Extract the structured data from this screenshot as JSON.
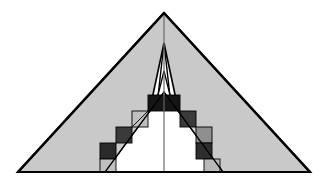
{
  "figure": {
    "type": "geometric-diagram",
    "canvas": {
      "width": 328,
      "height": 182,
      "background": "#ffffff"
    },
    "colors": {
      "outline": "#000000",
      "band_gray": "#c9c9c9",
      "band_white": "#ffffff",
      "center_line": "#6b6b6b",
      "thin_line": "#222222",
      "square_black": "#151515",
      "square_dark": "#3a3a3a",
      "square_medium": "#8f8f8f",
      "square_light": "#c0c0c0",
      "baseline": "#000000"
    },
    "geometry": {
      "apex_x": 164,
      "apex_y": 13,
      "baseline_y": 172,
      "left_vertex_x": 18,
      "right_vertex_x": 310,
      "outer_stroke_width": 2.2,
      "inner_stroke_width": 1.1,
      "center_line_width": 1.2,
      "band_count": 3,
      "staircase_steps": 5
    },
    "bands": [
      {
        "name": "outer-gray-band",
        "fill": "#c9c9c9",
        "apex_offset": 0,
        "thickness": 30
      },
      {
        "name": "middle-white-band",
        "fill": "#ffffff",
        "apex_offset": 30,
        "thickness": 28
      },
      {
        "name": "inner-white-band",
        "fill": "#ffffff",
        "apex_offset": 58,
        "thickness": 30
      }
    ],
    "left_staircase": [
      {
        "index": 0,
        "shade": "#151515",
        "label": "black"
      },
      {
        "index": 1,
        "shade": "#c0c0c0",
        "label": "light-gray"
      },
      {
        "index": 2,
        "shade": "#3a3a3a",
        "label": "dark-gray"
      },
      {
        "index": 3,
        "shade": "#2a2a2a",
        "label": "dark-gray"
      },
      {
        "index": 4,
        "shade": "#c0c0c0",
        "label": "light-gray"
      }
    ],
    "right_staircase": [
      {
        "index": 0,
        "shade": "#151515",
        "label": "black"
      },
      {
        "index": 1,
        "shade": "#3a3a3a",
        "label": "dark-gray"
      },
      {
        "index": 2,
        "shade": "#8f8f8f",
        "label": "medium-gray"
      },
      {
        "index": 3,
        "shade": "#2e2e2e",
        "label": "dark-gray"
      },
      {
        "index": 4,
        "shade": "#b8b8b8",
        "label": "light-gray"
      }
    ],
    "caption": ""
  }
}
